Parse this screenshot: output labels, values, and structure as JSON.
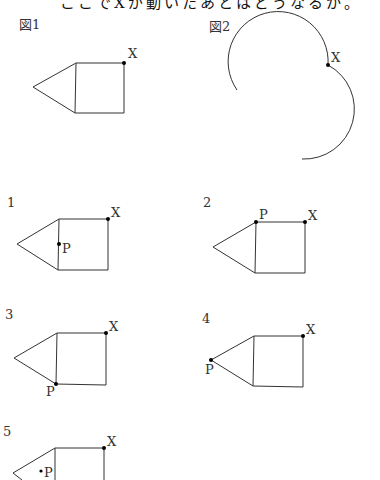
{
  "header": {
    "cut_text": "ここでXが動いたあとはどうなるか。"
  },
  "figures": {
    "fig1": {
      "label": "図1",
      "point": "X"
    },
    "fig2": {
      "label": "図2",
      "point": "X"
    }
  },
  "options": [
    {
      "number": "1",
      "point_x": "X",
      "point_p": "P",
      "p_position": "midpoint of left side of square"
    },
    {
      "number": "2",
      "point_x": "X",
      "point_p": "P",
      "p_position": "top-left corner of square"
    },
    {
      "number": "3",
      "point_x": "X",
      "point_p": "P",
      "p_position": "bottom-left corner of square"
    },
    {
      "number": "4",
      "point_x": "X",
      "point_p": "P",
      "p_position": "apex of triangle"
    },
    {
      "number": "5",
      "point_x": "X",
      "point_p": "P",
      "p_position": "inside triangle"
    }
  ]
}
